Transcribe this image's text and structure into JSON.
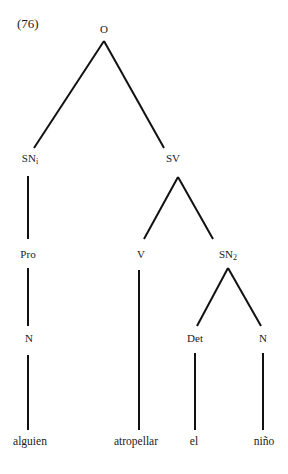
{
  "example_number": "(76)",
  "nodes": {
    "root": {
      "label": "O"
    },
    "sn1": {
      "label": "SN",
      "subscript": "i"
    },
    "sv": {
      "label": "SV"
    },
    "pro": {
      "label": "Pro"
    },
    "n1": {
      "label": "N"
    },
    "v": {
      "label": "V"
    },
    "sn2": {
      "label": "SN",
      "subscript": "2"
    },
    "det": {
      "label": "Det"
    },
    "n2": {
      "label": "N"
    }
  },
  "leaves": {
    "alguien": "alguien",
    "atropellar": "atropellar",
    "el": "el",
    "nino": "niño"
  },
  "line_color": "#111111"
}
